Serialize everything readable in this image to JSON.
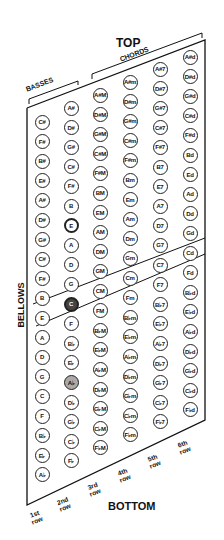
{
  "labels": {
    "top": "TOP",
    "bottom": "BOTTOM",
    "bellows": "BELLOWS",
    "basses": "BASSES",
    "chords": "CHORDS"
  },
  "rows": [
    {
      "label1": "1st",
      "label2": "row"
    },
    {
      "label1": "2nd",
      "label2": "row"
    },
    {
      "label1": "3rd",
      "label2": "row"
    },
    {
      "label1": "4th",
      "label2": "row"
    },
    {
      "label1": "5th",
      "label2": "row"
    },
    {
      "label1": "6th",
      "label2": "row"
    }
  ],
  "columns": [
    {
      "group": "basses",
      "buttons": [
        "C#",
        "F#",
        "B#",
        "E#",
        "A#",
        "D#",
        "G#",
        "C#",
        "F#",
        "B",
        "E",
        "A",
        "D",
        "G",
        "C",
        "F",
        "B♭",
        "E♭",
        "A♭",
        "D♭"
      ]
    },
    {
      "group": "basses",
      "buttons": [
        "A#",
        "D#",
        "G#",
        "C#",
        "F#",
        "B",
        "E",
        "A",
        "D",
        "G",
        "C",
        "F",
        "B♭",
        "E♭",
        "A♭",
        "D♭",
        "G♭",
        "C♭",
        "F♭",
        "B♭♭"
      ]
    },
    {
      "group": "chords",
      "buttons": [
        "A#M",
        "D#M",
        "G#M",
        "C#M",
        "F#M",
        "BM",
        "EM",
        "AM",
        "DM",
        "GM",
        "CM",
        "FM",
        "B♭M",
        "E♭M",
        "A♭M",
        "D♭M",
        "G♭M",
        "C♭M",
        "F♭M",
        "B♭♭M"
      ]
    },
    {
      "group": "chords",
      "buttons": [
        "A#m",
        "D#m",
        "G#m",
        "C#m",
        "F#m",
        "Bm",
        "Em",
        "Am",
        "Dm",
        "Gm",
        "Cm",
        "Fm",
        "B♭m",
        "E♭m",
        "A♭m",
        "D♭m",
        "G♭m",
        "C♭m",
        "F♭m",
        "B♭♭m"
      ]
    },
    {
      "group": "chords",
      "buttons": [
        "A#7",
        "D#7",
        "G#7",
        "C#7",
        "F#7",
        "B7",
        "E7",
        "A7",
        "D7",
        "G7",
        "C7",
        "F7",
        "B♭7",
        "E♭7",
        "A♭7",
        "D♭7",
        "G♭7",
        "C♭7",
        "F♭7",
        "B♭♭7"
      ]
    },
    {
      "group": "chords",
      "buttons": [
        "A#d",
        "D#d",
        "G#d",
        "C#d",
        "F#d",
        "Bd",
        "Ed",
        "Ad",
        "Dd",
        "Gd",
        "Cd",
        "Fd",
        "B♭d",
        "E♭d",
        "A♭d",
        "D♭d",
        "G♭d",
        "C♭d",
        "F♭d",
        "B♭♭d"
      ]
    }
  ],
  "highlights": {
    "marked": [
      [
        1,
        6
      ]
    ],
    "dark": [
      [
        1,
        10
      ]
    ],
    "shaded": [
      [
        1,
        14
      ]
    ]
  }
}
